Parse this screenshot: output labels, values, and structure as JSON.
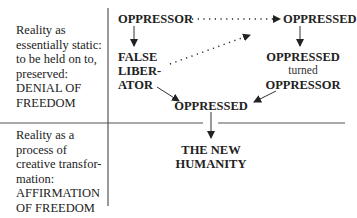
{
  "rows": [
    {
      "label": "Reality as\nessentially static:\nto be held on to,\npreserved:\nDENIAL OF\nFREEDOM"
    },
    {
      "label": "Reality as a\nprocess of\ncreative transfor-\nmation:\nAFFIRMATION\nOF FREEDOM"
    }
  ],
  "nodes": {
    "oppressor": "OPPRESSOR",
    "oppressed_top": "OPPRESSED",
    "false_liberator": "FALSE\nLIBER-\nATOR",
    "oppressed_turned_top": "OPPRESSED",
    "turned": "turned",
    "oppressed_turned_bottom": "OPPRESSOR",
    "oppressed_center": "OPPRESSED",
    "new_humanity": "THE NEW\nHUMANITY"
  },
  "colors": {
    "ink": "#222222",
    "line": "#555555",
    "background": "#ffffff"
  }
}
